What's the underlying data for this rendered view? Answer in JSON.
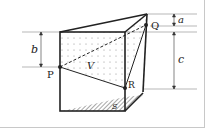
{
  "diagram": {
    "type": "geometry-figure",
    "points": [
      {
        "label": "P",
        "x": 60,
        "y": 67
      },
      {
        "label": "Q",
        "x": 146,
        "y": 25
      },
      {
        "label": "R",
        "x": 125,
        "y": 88
      }
    ],
    "regions": [
      {
        "label": "V",
        "style": "dotted",
        "description": "upper volume above cut plane"
      },
      {
        "label": "S",
        "style": "hatched",
        "description": "base area"
      }
    ],
    "dimensions": [
      {
        "label": "a",
        "side": "right",
        "from_y": 14,
        "to_y": 25
      },
      {
        "label": "b",
        "side": "left",
        "from_y": 32,
        "to_y": 67
      },
      {
        "label": "c",
        "side": "right",
        "from_y": 32,
        "to_y": 88
      }
    ],
    "colors": {
      "stroke": "#222222",
      "guide": "#888888",
      "frame": "#c8c8c8",
      "background": "#ffffff"
    }
  }
}
